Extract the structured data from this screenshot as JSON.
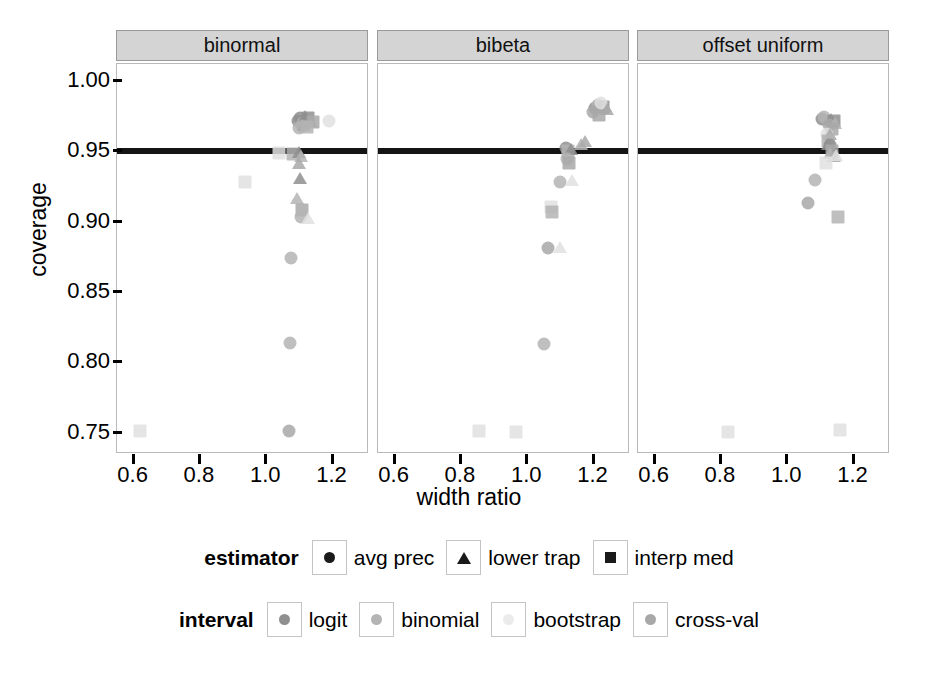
{
  "chart_data": {
    "type": "scatter",
    "title": "",
    "xlabel": "width ratio",
    "ylabel": "coverage",
    "xlim": [
      0.55,
      1.31
    ],
    "ylim": [
      0.735,
      1.012
    ],
    "xticks": [
      "0.6",
      "0.8",
      "1.0",
      "1.2"
    ],
    "xtick_values": [
      0.6,
      0.8,
      1.0,
      1.2
    ],
    "yticks": [
      "0.75",
      "0.80",
      "0.85",
      "0.90",
      "0.95",
      "1.00"
    ],
    "ytick_values": [
      0.75,
      0.8,
      0.85,
      0.9,
      0.95,
      1.0
    ],
    "grid": false,
    "reference_line": {
      "orientation": "horizontal",
      "value": 0.95,
      "color": "#141414",
      "label": "nominal 0.95 coverage"
    },
    "facets": [
      {
        "label": "binormal",
        "points": [
          {
            "x": 1.095,
            "y": 0.9715,
            "estimator": "avg prec",
            "interval": "logit"
          },
          {
            "x": 1.103,
            "y": 0.9735,
            "estimator": "avg prec",
            "interval": "logit"
          },
          {
            "x": 1.11,
            "y": 0.97,
            "estimator": "avg prec",
            "interval": "binomial"
          },
          {
            "x": 1.118,
            "y": 0.9725,
            "estimator": "lower trap",
            "interval": "logit"
          },
          {
            "x": 1.126,
            "y": 0.974,
            "estimator": "interp med",
            "interval": "logit"
          },
          {
            "x": 1.108,
            "y": 0.968,
            "estimator": "avg prec",
            "interval": "cross-val"
          },
          {
            "x": 1.133,
            "y": 0.969,
            "estimator": "lower trap",
            "interval": "binomial"
          },
          {
            "x": 1.14,
            "y": 0.9705,
            "estimator": "interp med",
            "interval": "cross-val"
          },
          {
            "x": 1.099,
            "y": 0.9665,
            "estimator": "avg prec",
            "interval": "binomial"
          },
          {
            "x": 1.115,
            "y": 0.966,
            "estimator": "lower trap",
            "interval": "cross-val"
          },
          {
            "x": 1.122,
            "y": 0.967,
            "estimator": "interp med",
            "interval": "binomial"
          },
          {
            "x": 1.19,
            "y": 0.9715,
            "estimator": "avg prec",
            "interval": "bootstrap"
          },
          {
            "x": 1.04,
            "y": 0.949,
            "estimator": "interp med",
            "interval": "bootstrap"
          },
          {
            "x": 1.082,
            "y": 0.948,
            "estimator": "interp med",
            "interval": "binomial"
          },
          {
            "x": 1.1,
            "y": 0.947,
            "estimator": "lower trap",
            "interval": "logit"
          },
          {
            "x": 1.106,
            "y": 0.944,
            "estimator": "lower trap",
            "interval": "binomial"
          },
          {
            "x": 1.098,
            "y": 0.939,
            "estimator": "lower trap",
            "interval": "cross-val"
          },
          {
            "x": 1.102,
            "y": 0.928,
            "estimator": "lower trap",
            "interval": "logit"
          },
          {
            "x": 1.092,
            "y": 0.914,
            "estimator": "lower trap",
            "interval": "binomial"
          },
          {
            "x": 1.108,
            "y": 0.908,
            "estimator": "interp med",
            "interval": "cross-val"
          },
          {
            "x": 1.104,
            "y": 0.903,
            "estimator": "avg prec",
            "interval": "binomial"
          },
          {
            "x": 1.127,
            "y": 0.8995,
            "estimator": "lower trap",
            "interval": "bootstrap"
          },
          {
            "x": 0.935,
            "y": 0.9285,
            "estimator": "interp med",
            "interval": "bootstrap"
          },
          {
            "x": 1.075,
            "y": 0.8745,
            "estimator": "avg prec",
            "interval": "binomial"
          },
          {
            "x": 1.072,
            "y": 0.8135,
            "estimator": "avg prec",
            "interval": "binomial"
          },
          {
            "x": 1.068,
            "y": 0.751,
            "estimator": "avg prec",
            "interval": "cross-val"
          },
          {
            "x": 0.62,
            "y": 0.7515,
            "estimator": "interp med",
            "interval": "bootstrap"
          }
        ]
      },
      {
        "label": "bibeta",
        "points": [
          {
            "x": 1.205,
            "y": 0.981,
            "estimator": "avg prec",
            "interval": "logit"
          },
          {
            "x": 1.212,
            "y": 0.983,
            "estimator": "avg prec",
            "interval": "binomial"
          },
          {
            "x": 1.22,
            "y": 0.979,
            "estimator": "lower trap",
            "interval": "logit"
          },
          {
            "x": 1.228,
            "y": 0.9815,
            "estimator": "interp med",
            "interval": "logit"
          },
          {
            "x": 1.198,
            "y": 0.978,
            "estimator": "avg prec",
            "interval": "cross-val"
          },
          {
            "x": 1.235,
            "y": 0.9795,
            "estimator": "lower trap",
            "interval": "binomial"
          },
          {
            "x": 1.215,
            "y": 0.976,
            "estimator": "interp med",
            "interval": "cross-val"
          },
          {
            "x": 1.222,
            "y": 0.9845,
            "estimator": "avg prec",
            "interval": "bootstrap"
          },
          {
            "x": 1.24,
            "y": 0.9775,
            "estimator": "lower trap",
            "interval": "cross-val"
          },
          {
            "x": 1.118,
            "y": 0.952,
            "estimator": "avg prec",
            "interval": "logit"
          },
          {
            "x": 1.124,
            "y": 0.9505,
            "estimator": "interp med",
            "interval": "binomial"
          },
          {
            "x": 1.131,
            "y": 0.949,
            "estimator": "lower trap",
            "interval": "logit"
          },
          {
            "x": 1.162,
            "y": 0.9525,
            "estimator": "lower trap",
            "interval": "binomial"
          },
          {
            "x": 1.175,
            "y": 0.9545,
            "estimator": "lower trap",
            "interval": "cross-val"
          },
          {
            "x": 1.12,
            "y": 0.9445,
            "estimator": "avg prec",
            "interval": "binomial"
          },
          {
            "x": 1.126,
            "y": 0.942,
            "estimator": "interp med",
            "interval": "cross-val"
          },
          {
            "x": 1.1,
            "y": 0.9285,
            "estimator": "avg prec",
            "interval": "binomial"
          },
          {
            "x": 1.135,
            "y": 0.927,
            "estimator": "lower trap",
            "interval": "bootstrap"
          },
          {
            "x": 1.072,
            "y": 0.9105,
            "estimator": "interp med",
            "interval": "bootstrap"
          },
          {
            "x": 1.075,
            "y": 0.907,
            "estimator": "interp med",
            "interval": "binomial"
          },
          {
            "x": 1.062,
            "y": 0.881,
            "estimator": "avg prec",
            "interval": "cross-val"
          },
          {
            "x": 1.098,
            "y": 0.879,
            "estimator": "lower trap",
            "interval": "bootstrap"
          },
          {
            "x": 1.05,
            "y": 0.813,
            "estimator": "avg prec",
            "interval": "binomial"
          },
          {
            "x": 0.855,
            "y": 0.751,
            "estimator": "interp med",
            "interval": "bootstrap"
          },
          {
            "x": 0.965,
            "y": 0.7505,
            "estimator": "interp med",
            "interval": "bootstrap"
          }
        ]
      },
      {
        "label": "offset uniform",
        "points": [
          {
            "x": 1.105,
            "y": 0.973,
            "estimator": "avg prec",
            "interval": "logit"
          },
          {
            "x": 1.112,
            "y": 0.9745,
            "estimator": "avg prec",
            "interval": "binomial"
          },
          {
            "x": 1.132,
            "y": 0.97,
            "estimator": "lower trap",
            "interval": "logit"
          },
          {
            "x": 1.14,
            "y": 0.9715,
            "estimator": "interp med",
            "interval": "logit"
          },
          {
            "x": 1.126,
            "y": 0.969,
            "estimator": "avg prec",
            "interval": "cross-val"
          },
          {
            "x": 1.145,
            "y": 0.9675,
            "estimator": "lower trap",
            "interval": "binomial"
          },
          {
            "x": 1.136,
            "y": 0.9655,
            "estimator": "interp med",
            "interval": "cross-val"
          },
          {
            "x": 1.12,
            "y": 0.962,
            "estimator": "avg prec",
            "interval": "bootstrap"
          },
          {
            "x": 1.128,
            "y": 0.9595,
            "estimator": "lower trap",
            "interval": "cross-val"
          },
          {
            "x": 1.124,
            "y": 0.957,
            "estimator": "interp med",
            "interval": "binomial"
          },
          {
            "x": 1.13,
            "y": 0.9545,
            "estimator": "avg prec",
            "interval": "logit"
          },
          {
            "x": 1.122,
            "y": 0.952,
            "estimator": "lower trap",
            "interval": "logit"
          },
          {
            "x": 1.134,
            "y": 0.9505,
            "estimator": "interp med",
            "interval": "cross-val"
          },
          {
            "x": 1.128,
            "y": 0.946,
            "estimator": "lower trap",
            "interval": "binomial"
          },
          {
            "x": 1.14,
            "y": 0.9435,
            "estimator": "lower trap",
            "interval": "cross-val"
          },
          {
            "x": 1.148,
            "y": 0.9445,
            "estimator": "lower trap",
            "interval": "bootstrap"
          },
          {
            "x": 1.118,
            "y": 0.9415,
            "estimator": "interp med",
            "interval": "bootstrap"
          },
          {
            "x": 1.085,
            "y": 0.9295,
            "estimator": "avg prec",
            "interval": "binomial"
          },
          {
            "x": 1.062,
            "y": 0.913,
            "estimator": "avg prec",
            "interval": "cross-val"
          },
          {
            "x": 1.152,
            "y": 0.9035,
            "estimator": "interp med",
            "interval": "binomial"
          },
          {
            "x": 0.82,
            "y": 0.7505,
            "estimator": "interp med",
            "interval": "bootstrap"
          },
          {
            "x": 1.16,
            "y": 0.752,
            "estimator": "interp med",
            "interval": "bootstrap"
          }
        ]
      }
    ]
  },
  "axes": {
    "ylabel": "coverage",
    "xlabel": "width ratio",
    "ytick_labels": [
      "1.00",
      "0.95",
      "0.90",
      "0.85",
      "0.80",
      "0.75"
    ],
    "xtick_labels": [
      "0.6",
      "0.8",
      "1.0",
      "1.2"
    ]
  },
  "panels": [
    {
      "title": "binormal"
    },
    {
      "title": "bibeta"
    },
    {
      "title": "offset uniform"
    }
  ],
  "legends": [
    {
      "id": "estimator",
      "title": "estimator",
      "entries": [
        {
          "label": "avg prec",
          "shape": "circle",
          "icon": "circle-marker-icon"
        },
        {
          "label": "lower trap",
          "shape": "triangle",
          "icon": "triangle-marker-icon"
        },
        {
          "label": "interp med",
          "shape": "square",
          "icon": "square-marker-icon"
        }
      ]
    },
    {
      "id": "interval",
      "title": "interval",
      "entries": [
        {
          "label": "logit",
          "shape": "circle",
          "icon": "circle-marker-icon",
          "color": "#8f8f8f"
        },
        {
          "label": "binomial",
          "shape": "circle",
          "icon": "circle-marker-icon",
          "color": "#b4b4b4"
        },
        {
          "label": "bootstrap",
          "shape": "circle",
          "icon": "circle-marker-icon",
          "color": "#ebebeb"
        },
        {
          "label": "cross-val",
          "shape": "circle",
          "icon": "circle-marker-icon",
          "color": "#a8a8a8"
        }
      ]
    }
  ],
  "colors": {
    "logit": "#8f8f8f",
    "binomial": "#b4b4b4",
    "bootstrap": "#e0e0e0",
    "cross-val": "#a8a8a8",
    "reference_line": "#141414",
    "strip_background": "#d4d4d4",
    "panel_border": "#b9b9b9"
  }
}
